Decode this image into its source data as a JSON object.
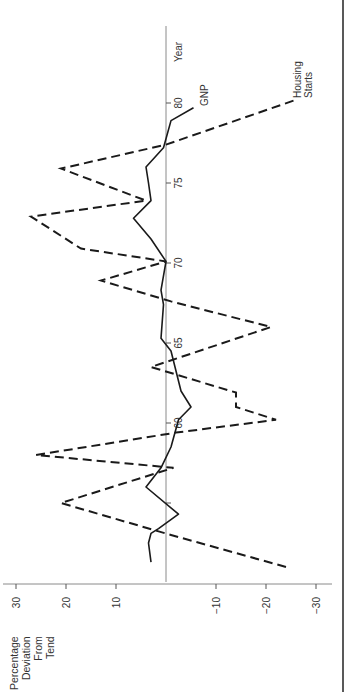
{
  "chart_data": {
    "type": "line",
    "orientation": "rotated-90-clockwise",
    "title": "",
    "xlabel": "Year",
    "ylabel": "Percentage Deviation From Tend",
    "ylabel_lines": [
      "Percentage",
      "Deviation",
      "From",
      "Tend"
    ],
    "x_ticks": [
      55,
      60,
      65,
      70,
      75,
      80
    ],
    "x_tick_labels": [
      "",
      "60",
      "65",
      "70",
      "75",
      "80"
    ],
    "y_ticks": [
      30,
      20,
      10,
      -10,
      -20,
      -30
    ],
    "y_tick_labels": [
      "30",
      "20",
      "10",
      "−10",
      "−20",
      "−30"
    ],
    "xlim": [
      1950,
      1982
    ],
    "ylim": [
      -32,
      32
    ],
    "grid": false,
    "legend": "inline labels",
    "series": [
      {
        "name": "Housing Starts",
        "label_lines": [
          "Housing",
          "Starts"
        ],
        "style": "dashed",
        "x": [
          1951.0,
          1953.0,
          1955.0,
          1957.2,
          1958.0,
          1959.4,
          1960.2,
          1961.0,
          1961.9,
          1963.5,
          1966.0,
          1967.6,
          1968.9,
          1970.1,
          1970.9,
          1972.9,
          1973.9,
          1975.9,
          1977.4,
          1980.2
        ],
        "values": [
          -24,
          -1,
          21,
          -1.5,
          26,
          -2,
          -22,
          -14,
          -14,
          3,
          -21,
          -1,
          13,
          0,
          17,
          27,
          4,
          21,
          0,
          -26
        ]
      },
      {
        "name": "GNP",
        "label_lines": [
          "GNP"
        ],
        "style": "solid",
        "x": [
          1951.3,
          1952.5,
          1953.1,
          1953.4,
          1954.3,
          1956.0,
          1957.2,
          1958.5,
          1960.2,
          1961.0,
          1962.0,
          1964.5,
          1965.3,
          1967.4,
          1968.3,
          1970.1,
          1971.5,
          1972.8,
          1973.9,
          1975.0,
          1976.0,
          1977.2,
          1978.9,
          1979.7
        ],
        "values": [
          3,
          3.5,
          3,
          1.5,
          -2.5,
          4,
          1,
          -1,
          -2.5,
          -5,
          -3,
          -1,
          1,
          0.5,
          1,
          0,
          3,
          6.5,
          3,
          3.5,
          4,
          0.5,
          -1,
          -5.5
        ]
      }
    ]
  }
}
